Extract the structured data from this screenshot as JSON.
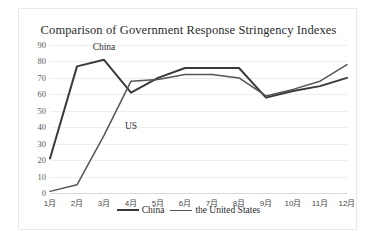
{
  "chart_data": {
    "type": "line",
    "title": "Comparison of Government Response Stringency Indexes",
    "xlabel": "",
    "ylabel": "",
    "ylim": [
      0,
      90
    ],
    "ytick_step": 10,
    "yticks": [
      "90",
      "80",
      "70",
      "60",
      "50",
      "40",
      "30",
      "20",
      "10",
      "0"
    ],
    "categories": [
      "1月",
      "2月",
      "3月",
      "4月",
      "5月",
      "6月",
      "7月",
      "8月",
      "9月",
      "10月",
      "11月",
      "12月"
    ],
    "series": [
      {
        "name": "China",
        "color": "#3a3a3a",
        "values": [
          21,
          77,
          81,
          61,
          70,
          76,
          76,
          76,
          58,
          62,
          65,
          70
        ]
      },
      {
        "name": "the United States",
        "color": "#555555",
        "values": [
          1,
          5,
          35,
          68,
          69,
          72,
          72,
          70,
          59,
          63,
          68,
          78
        ]
      }
    ],
    "annotations": [
      {
        "text": "China",
        "x_category_index": 2,
        "y_value": 88
      },
      {
        "text": "US",
        "x_category_index": 3,
        "y_value": 40
      }
    ],
    "legend": {
      "position": "bottom-center",
      "entries": [
        "China",
        "the United States"
      ]
    },
    "grid": {
      "horizontal": true,
      "vertical": false
    },
    "background": "#ffffff",
    "border_color": "#e9e9e9"
  }
}
